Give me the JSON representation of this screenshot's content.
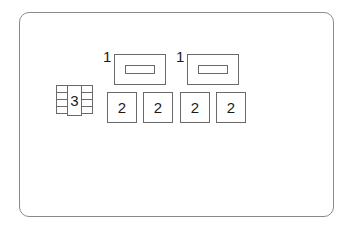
{
  "diagram": {
    "type": "fuse-box-layout",
    "frame": {
      "shape": "rounded-rectangle",
      "border_color": "#8a8a8a"
    },
    "components": [
      {
        "id": "relay-1a",
        "label": "1",
        "kind": "relay-with-slot"
      },
      {
        "id": "relay-1b",
        "label": "1",
        "kind": "relay-with-slot"
      },
      {
        "id": "fuse-2a",
        "label": "2",
        "kind": "square-fuse"
      },
      {
        "id": "fuse-2b",
        "label": "2",
        "kind": "square-fuse"
      },
      {
        "id": "fuse-2c",
        "label": "2",
        "kind": "square-fuse"
      },
      {
        "id": "fuse-2d",
        "label": "2",
        "kind": "square-fuse"
      },
      {
        "id": "connector-3",
        "label": "3",
        "kind": "multi-pin-connector"
      }
    ],
    "line_color": "#6a6a6a",
    "text_color": "#1a1a1a"
  }
}
